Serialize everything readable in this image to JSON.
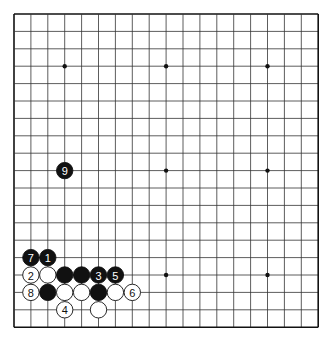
{
  "board": {
    "size": 19,
    "origin_x": 14,
    "origin_y": 14,
    "step_x": 16.9,
    "step_y": 17.4,
    "line_color": "#333333",
    "border_color": "#111111",
    "background": "#ffffff",
    "star_points": [
      [
        3,
        3
      ],
      [
        9,
        3
      ],
      [
        15,
        3
      ],
      [
        3,
        9
      ],
      [
        9,
        9
      ],
      [
        15,
        9
      ],
      [
        3,
        15
      ],
      [
        9,
        15
      ],
      [
        15,
        15
      ]
    ]
  },
  "stones": [
    {
      "col": 1,
      "row": 14,
      "color": "black",
      "label": "7"
    },
    {
      "col": 2,
      "row": 14,
      "color": "black",
      "label": "1"
    },
    {
      "col": 1,
      "row": 15,
      "color": "white",
      "label": "2"
    },
    {
      "col": 2,
      "row": 15,
      "color": "white",
      "label": ""
    },
    {
      "col": 3,
      "row": 15,
      "color": "black",
      "label": ""
    },
    {
      "col": 4,
      "row": 15,
      "color": "black",
      "label": ""
    },
    {
      "col": 5,
      "row": 15,
      "color": "black",
      "label": "3"
    },
    {
      "col": 6,
      "row": 15,
      "color": "black",
      "label": "5"
    },
    {
      "col": 1,
      "row": 16,
      "color": "white",
      "label": "8"
    },
    {
      "col": 2,
      "row": 16,
      "color": "black",
      "label": ""
    },
    {
      "col": 3,
      "row": 16,
      "color": "white",
      "label": ""
    },
    {
      "col": 4,
      "row": 16,
      "color": "white",
      "label": ""
    },
    {
      "col": 5,
      "row": 16,
      "color": "black",
      "label": ""
    },
    {
      "col": 6,
      "row": 16,
      "color": "white",
      "label": ""
    },
    {
      "col": 7,
      "row": 16,
      "color": "white",
      "label": "6"
    },
    {
      "col": 3,
      "row": 17,
      "color": "white",
      "label": "4"
    },
    {
      "col": 5,
      "row": 17,
      "color": "white",
      "label": ""
    },
    {
      "col": 3,
      "row": 9,
      "color": "black",
      "label": "9"
    }
  ]
}
